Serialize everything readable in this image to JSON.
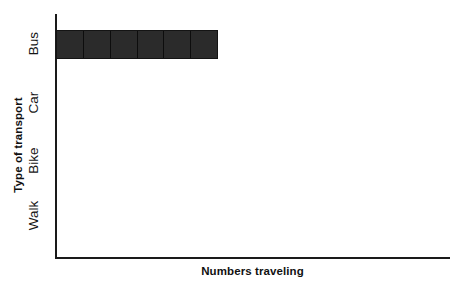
{
  "chart_data": {
    "type": "bar",
    "orientation": "horizontal",
    "title": "",
    "xlabel": "Numbers traveling",
    "ylabel": "Type of transport",
    "categories": [
      "Bus",
      "Car",
      "Bike",
      "Walk"
    ],
    "values": [
      6,
      0,
      0,
      0
    ],
    "unit_segments": true,
    "segments_per_unit": 1,
    "xlim": [
      0,
      15
    ],
    "ylim": null,
    "grid": false,
    "tick_labels_x": [],
    "legend": null,
    "legend_position": "none",
    "annotations": [],
    "bar_color": "#2b2b2b",
    "segment_divider_color": "#0d0d0d",
    "axis_color": "#1a1a1a",
    "background_color": "#ffffff"
  },
  "axes": {
    "y_title": "Type of transport",
    "x_title": "Numbers traveling"
  },
  "categories": [
    {
      "label": "Bus",
      "value": 6,
      "segments": [
        1,
        1,
        1,
        1,
        1,
        1
      ]
    },
    {
      "label": "Car",
      "value": 0,
      "segments": []
    },
    {
      "label": "Bike",
      "value": 0,
      "segments": []
    },
    {
      "label": "Walk",
      "value": 0,
      "segments": []
    }
  ]
}
